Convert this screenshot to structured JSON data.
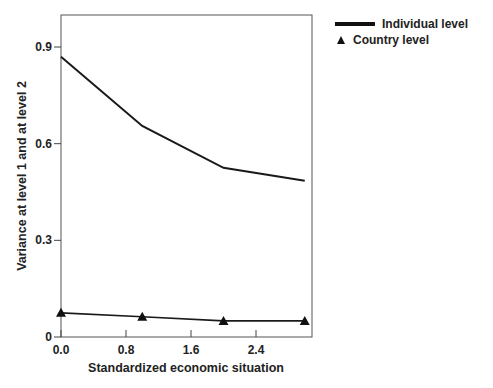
{
  "chart_data": {
    "type": "line",
    "title": "",
    "xlabel": "Standardized economic situation",
    "ylabel": "Variance at level 1 and at level 2",
    "x": [
      0.0,
      1.0,
      2.0,
      3.0
    ],
    "xticks": [
      "0.0",
      "0.8",
      "1.6",
      "2.4"
    ],
    "yticks": [
      "0",
      "0.3",
      "0.6",
      "0.9"
    ],
    "xlim": [
      0.0,
      3.1
    ],
    "ylim": [
      0,
      0.97
    ],
    "grid": false,
    "legend_position": "top-right outside",
    "series": [
      {
        "name": "Individual level",
        "marker": "none",
        "values": [
          0.87,
          0.655,
          0.525,
          0.485
        ]
      },
      {
        "name": "Country level",
        "marker": "triangle",
        "values": [
          0.075,
          0.063,
          0.05,
          0.05
        ]
      }
    ]
  },
  "legend": {
    "items": [
      {
        "label": "Individual level"
      },
      {
        "label": "Country level"
      }
    ]
  }
}
